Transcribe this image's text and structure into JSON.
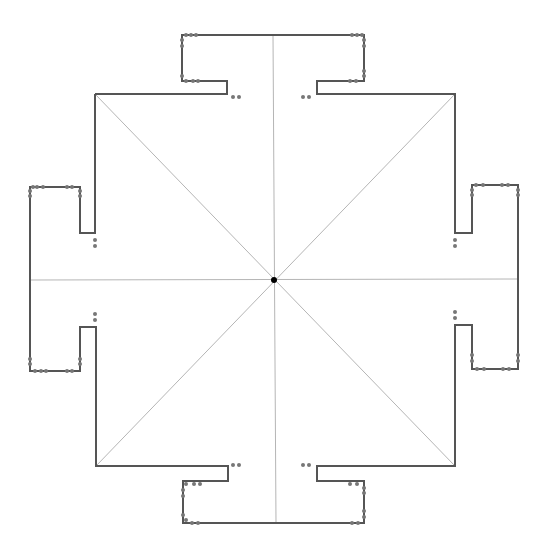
{
  "diagram": {
    "title": "",
    "colors": {
      "background": "#ffffff",
      "outline": "#555555",
      "guide": "#b5b5b5",
      "vertex": "#777777",
      "center": "#000000"
    },
    "center": {
      "x": 274,
      "y": 280
    },
    "outline_path": [
      [
        95,
        94
      ],
      [
        227,
        94
      ],
      [
        227,
        81
      ],
      [
        182,
        81
      ],
      [
        182,
        35
      ],
      [
        364,
        35
      ],
      [
        364,
        81
      ],
      [
        317,
        81
      ],
      [
        317,
        94
      ],
      [
        455,
        94
      ],
      [
        455,
        233
      ],
      [
        472,
        233
      ],
      [
        472,
        185
      ],
      [
        518,
        185
      ],
      [
        518,
        369
      ],
      [
        472,
        369
      ],
      [
        472,
        325
      ],
      [
        455,
        325
      ],
      [
        455,
        466
      ],
      [
        317,
        466
      ],
      [
        317,
        481
      ],
      [
        364,
        481
      ],
      [
        364,
        523
      ],
      [
        183,
        523
      ],
      [
        183,
        481
      ],
      [
        228,
        481
      ],
      [
        228,
        466
      ],
      [
        96,
        466
      ],
      [
        96,
        327
      ],
      [
        80,
        327
      ],
      [
        80,
        371
      ],
      [
        30,
        371
      ],
      [
        30,
        187
      ],
      [
        80,
        187
      ],
      [
        80,
        233
      ],
      [
        95,
        233
      ],
      [
        95,
        94
      ]
    ],
    "guides": [
      {
        "name": "vertical-axis",
        "x1": 273,
        "y1": 35,
        "x2": 276,
        "y2": 523
      },
      {
        "name": "horizontal-axis",
        "x1": 30,
        "y1": 280,
        "x2": 518,
        "y2": 279
      },
      {
        "name": "diagonal-tl-br",
        "x1": 95,
        "y1": 94,
        "x2": 455,
        "y2": 466
      },
      {
        "name": "diagonal-tr-bl",
        "x1": 455,
        "y1": 94,
        "x2": 96,
        "y2": 466
      }
    ],
    "vertex_dots": [
      [
        186,
        35
      ],
      [
        191,
        35
      ],
      [
        196,
        35
      ],
      [
        182,
        40
      ],
      [
        182,
        46
      ],
      [
        182,
        76
      ],
      [
        186,
        81
      ],
      [
        193,
        81
      ],
      [
        198,
        81
      ],
      [
        352,
        35
      ],
      [
        357,
        35
      ],
      [
        362,
        35
      ],
      [
        364,
        40
      ],
      [
        364,
        46
      ],
      [
        364,
        71
      ],
      [
        364,
        76
      ],
      [
        350,
        81
      ],
      [
        356,
        81
      ],
      [
        33,
        187
      ],
      [
        37,
        187
      ],
      [
        43,
        187
      ],
      [
        30,
        191
      ],
      [
        30,
        196
      ],
      [
        67,
        187
      ],
      [
        72,
        187
      ],
      [
        80,
        191
      ],
      [
        80,
        196
      ],
      [
        30,
        359
      ],
      [
        30,
        364
      ],
      [
        35,
        371
      ],
      [
        41,
        371
      ],
      [
        46,
        371
      ],
      [
        67,
        371
      ],
      [
        72,
        371
      ],
      [
        80,
        359
      ],
      [
        80,
        364
      ],
      [
        476,
        185
      ],
      [
        483,
        185
      ],
      [
        502,
        185
      ],
      [
        508,
        185
      ],
      [
        518,
        190
      ],
      [
        518,
        195
      ],
      [
        472,
        190
      ],
      [
        472,
        195
      ],
      [
        472,
        355
      ],
      [
        472,
        361
      ],
      [
        477,
        369
      ],
      [
        484,
        369
      ],
      [
        503,
        369
      ],
      [
        509,
        369
      ],
      [
        518,
        355
      ],
      [
        518,
        361
      ],
      [
        186,
        484
      ],
      [
        194,
        484
      ],
      [
        200,
        484
      ],
      [
        183,
        490
      ],
      [
        183,
        496
      ],
      [
        183,
        515
      ],
      [
        186,
        520
      ],
      [
        192,
        523
      ],
      [
        198,
        523
      ],
      [
        350,
        484
      ],
      [
        357,
        484
      ],
      [
        364,
        488
      ],
      [
        364,
        493
      ],
      [
        364,
        511
      ],
      [
        364,
        517
      ],
      [
        352,
        523
      ],
      [
        358,
        523
      ]
    ],
    "inner_dots": [
      [
        233,
        97
      ],
      [
        239,
        97
      ],
      [
        303,
        97
      ],
      [
        309,
        97
      ],
      [
        95,
        240
      ],
      [
        95,
        246
      ],
      [
        455,
        240
      ],
      [
        455,
        246
      ],
      [
        95,
        314
      ],
      [
        95,
        320
      ],
      [
        455,
        312
      ],
      [
        455,
        318
      ],
      [
        233,
        465
      ],
      [
        239,
        465
      ],
      [
        303,
        465
      ],
      [
        309,
        465
      ]
    ]
  }
}
